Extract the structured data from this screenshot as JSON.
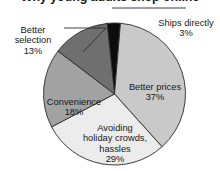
{
  "chart_data": {
    "type": "pie",
    "title": "Why young adults shop online",
    "xlabel": "",
    "ylabel": "",
    "legend": "none",
    "grid": false,
    "unit": "%",
    "categories": [
      "Ships directly",
      "Better prices",
      "Avoiding holiday crowds, hassles",
      "Convenience",
      "Better selection"
    ],
    "values": [
      3,
      37,
      29,
      18,
      13
    ],
    "slices": [
      {
        "label": "Ships directly",
        "label_lines": "Ships directly",
        "value": 3,
        "pct_text": "3%",
        "color": "#0d0d0d",
        "label_position": "outside-right",
        "has_leader_line": true
      },
      {
        "label": "Better prices",
        "label_lines": "Better prices",
        "value": 37,
        "pct_text": "37%",
        "color": "#c9c9c9",
        "label_position": "inside",
        "has_leader_line": false
      },
      {
        "label": "Avoiding holiday crowds, hassles",
        "label_lines": "Avoiding\nholiday crowds,\nhassles",
        "value": 29,
        "pct_text": "29%",
        "color": "#ececec",
        "label_position": "inside",
        "has_leader_line": false
      },
      {
        "label": "Convenience",
        "label_lines": "Convenience",
        "value": 18,
        "pct_text": "18%",
        "color": "#a2a2a2",
        "label_position": "inside",
        "has_leader_line": false
      },
      {
        "label": "Better selection",
        "label_lines": "Better\nselection",
        "value": 13,
        "pct_text": "13%",
        "color": "#6f6f6f",
        "label_position": "outside-left",
        "has_leader_line": true
      }
    ]
  },
  "colors": {
    "background": "#ffffff",
    "text": "#181818",
    "title_text": "#1a1a1a",
    "slice_outline": "#2b2b2b",
    "leader_line": "#2b2b2b"
  }
}
